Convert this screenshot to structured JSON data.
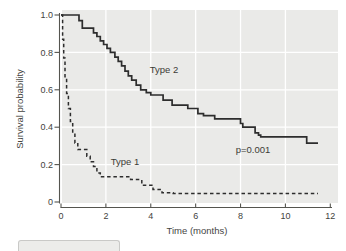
{
  "figure": {
    "x_axis_title": "Time (months)",
    "y_axis_title": "Survival probability",
    "annotation_type2": "Type 2",
    "annotation_type1": "Type 1",
    "annotation_pvalue": "p=0.001"
  },
  "colors": {
    "plot_background": "#eaeae8",
    "gridline": "#ffffff",
    "axis": "#55554f",
    "tick_text": "#42423d",
    "curve": "#2d2d2d",
    "annotation_text": "#3c3c37"
  },
  "chart_data": {
    "type": "line",
    "subtype": "kaplan-meier-step-survival",
    "title": "",
    "xlabel": "Time (months)",
    "ylabel": "Survival probability",
    "xlim": [
      0,
      12
    ],
    "ylim": [
      0,
      1.0
    ],
    "x_ticks": [
      0,
      2,
      4,
      6,
      8,
      10,
      12
    ],
    "x_tick_labels": [
      "0",
      "2",
      "4",
      "6",
      "8",
      "10",
      "12"
    ],
    "y_ticks": [
      0,
      0.2,
      0.4,
      0.6,
      0.8,
      1.0
    ],
    "y_tick_labels": [
      "0",
      "0.2",
      "0.4",
      "0.6",
      "0.8",
      "1.0"
    ],
    "grid": true,
    "legend_position": "inline-annotations",
    "annotations": [
      {
        "text": "Type 2",
        "x": 4.6,
        "y": 0.71
      },
      {
        "text": "Type 1",
        "x": 2.85,
        "y": 0.215
      },
      {
        "text": "p=0.001",
        "x": 8.56,
        "y": 0.283
      }
    ],
    "series": [
      {
        "name": "Type 2",
        "style": "solid",
        "points": [
          [
            0,
            1.0
          ],
          [
            0.8,
            0.97
          ],
          [
            0.95,
            0.93
          ],
          [
            1.45,
            0.905
          ],
          [
            1.6,
            0.885
          ],
          [
            1.75,
            0.862
          ],
          [
            1.9,
            0.842
          ],
          [
            2.05,
            0.822
          ],
          [
            2.2,
            0.8
          ],
          [
            2.4,
            0.775
          ],
          [
            2.55,
            0.752
          ],
          [
            2.7,
            0.728
          ],
          [
            2.85,
            0.7
          ],
          [
            3.0,
            0.675
          ],
          [
            3.15,
            0.652
          ],
          [
            3.35,
            0.625
          ],
          [
            3.55,
            0.6
          ],
          [
            3.8,
            0.585
          ],
          [
            4.0,
            0.572
          ],
          [
            4.55,
            0.545
          ],
          [
            4.95,
            0.518
          ],
          [
            5.65,
            0.5
          ],
          [
            6.1,
            0.472
          ],
          [
            6.35,
            0.462
          ],
          [
            6.85,
            0.445
          ],
          [
            8.0,
            0.42
          ],
          [
            8.1,
            0.4
          ],
          [
            8.65,
            0.37
          ],
          [
            8.8,
            0.358
          ],
          [
            8.9,
            0.348
          ],
          [
            10.95,
            0.315
          ],
          [
            11.45,
            0.315
          ]
        ]
      },
      {
        "name": "Type 1",
        "style": "dashed",
        "points": [
          [
            0,
            1.0
          ],
          [
            0.07,
            0.87
          ],
          [
            0.12,
            0.77
          ],
          [
            0.18,
            0.67
          ],
          [
            0.25,
            0.58
          ],
          [
            0.33,
            0.5
          ],
          [
            0.42,
            0.43
          ],
          [
            0.52,
            0.37
          ],
          [
            0.62,
            0.315
          ],
          [
            0.75,
            0.28
          ],
          [
            1.15,
            0.245
          ],
          [
            1.3,
            0.215
          ],
          [
            1.45,
            0.19
          ],
          [
            1.6,
            0.155
          ],
          [
            1.75,
            0.135
          ],
          [
            3.1,
            0.12
          ],
          [
            3.6,
            0.09
          ],
          [
            4.1,
            0.067
          ],
          [
            4.5,
            0.05
          ],
          [
            5.0,
            0.045
          ],
          [
            11.45,
            0.045
          ]
        ]
      }
    ]
  }
}
